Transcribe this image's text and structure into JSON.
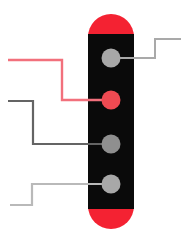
{
  "canvas": {
    "width": 195,
    "height": 238,
    "background": "#ffffff"
  },
  "device": {
    "label": "capsule-device",
    "body_color": "#0a0a0a",
    "cap_color": "#f42232",
    "x": 88,
    "y": 14,
    "width": 46,
    "height": 215,
    "cap_radius": 23
  },
  "dots": [
    {
      "id": "dot-1",
      "label": "terminal-1",
      "color": "#a8a8a8",
      "cx": 111,
      "cy": 58,
      "r": 9.5
    },
    {
      "id": "dot-2",
      "label": "terminal-2",
      "color": "#f04a52",
      "cx": 111,
      "cy": 100,
      "r": 9.5
    },
    {
      "id": "dot-3",
      "label": "terminal-3",
      "color": "#8f8f8f",
      "cx": 111,
      "cy": 144,
      "r": 9.5
    },
    {
      "id": "dot-4",
      "label": "terminal-4",
      "color": "#a8a8a8",
      "cx": 111,
      "cy": 184,
      "r": 9.5
    }
  ],
  "callouts": [
    {
      "id": "callout-right-top",
      "label": "callout-terminal-1",
      "color": "#a9a9a9",
      "width": 2,
      "points": "111,58 155,58 155,39 181,39"
    },
    {
      "id": "callout-left-red",
      "label": "callout-terminal-2",
      "color": "#f2707c",
      "width": 2.4,
      "points": "8,60 62,60 62,100 111,100"
    },
    {
      "id": "callout-left-dark",
      "label": "callout-terminal-3",
      "color": "#646464",
      "width": 2.2,
      "points": "8,101 33,101 33,144 111,144"
    },
    {
      "id": "callout-left-light",
      "label": "callout-terminal-4",
      "color": "#b9b9b9",
      "width": 2.2,
      "points": "10,205 32,205 32,184 111,184"
    }
  ]
}
